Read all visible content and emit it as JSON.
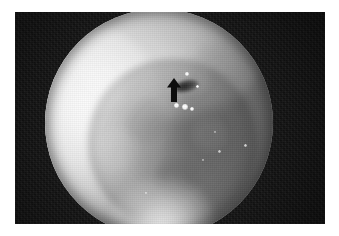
{
  "image": {
    "kind": "endoscopic-photograph",
    "modality": "white-light endoscopy",
    "color_mode": "grayscale",
    "width_px": 339,
    "height_px": 236,
    "background_color": "#ffffff",
    "frame": {
      "name": "photo-frame",
      "color": "#141414",
      "left_px": 15,
      "top_px": 12,
      "width_px": 310,
      "height_px": 212
    },
    "scope_field": {
      "name": "circular-field-of-view",
      "shape": "circle",
      "center_x_px": 159,
      "center_y_px": 123,
      "radius_px": 114,
      "brightest_region": "upper-left rim",
      "darkest_region": "central lumen"
    },
    "annotations": [
      {
        "name": "arrow-marker",
        "glyph": "up-arrow",
        "color": "#0d0d0d",
        "x_px": 166,
        "y_px": 78,
        "width_px": 16,
        "height_px": 24,
        "points_to": "dark mucosal crevice"
      }
    ],
    "features": [
      {
        "name": "mucosal-fold-upper",
        "description": "arching fold across upper field"
      },
      {
        "name": "mucosal-fold-left",
        "description": "bright overexposed wall at left"
      },
      {
        "name": "central-lumen",
        "description": "darker depressed central region"
      },
      {
        "name": "dark-crevice",
        "description": "small dark groove indicated by arrow"
      },
      {
        "name": "light-flare-bottom",
        "description": "bright flare at lower field margin"
      }
    ],
    "specular_highlights": [
      {
        "name": "specular-highlight-1",
        "x_px": 176,
        "y_px": 105,
        "size_px": 5
      },
      {
        "name": "specular-highlight-2",
        "x_px": 185,
        "y_px": 107,
        "size_px": 6
      },
      {
        "name": "specular-highlight-3",
        "x_px": 192,
        "y_px": 109,
        "size_px": 4
      },
      {
        "name": "specular-highlight-4",
        "x_px": 187,
        "y_px": 74,
        "size_px": 4
      },
      {
        "name": "specular-highlight-5",
        "x_px": 197,
        "y_px": 86,
        "size_px": 3
      },
      {
        "name": "specular-highlight-6",
        "x_px": 245,
        "y_px": 145,
        "size_px": 3
      },
      {
        "name": "specular-highlight-7",
        "x_px": 219,
        "y_px": 151,
        "size_px": 3
      },
      {
        "name": "specular-highlight-8",
        "x_px": 203,
        "y_px": 160,
        "size_px": 2
      },
      {
        "name": "specular-highlight-9",
        "x_px": 146,
        "y_px": 193,
        "size_px": 2
      },
      {
        "name": "specular-highlight-10",
        "x_px": 215,
        "y_px": 132,
        "size_px": 2
      }
    ]
  }
}
